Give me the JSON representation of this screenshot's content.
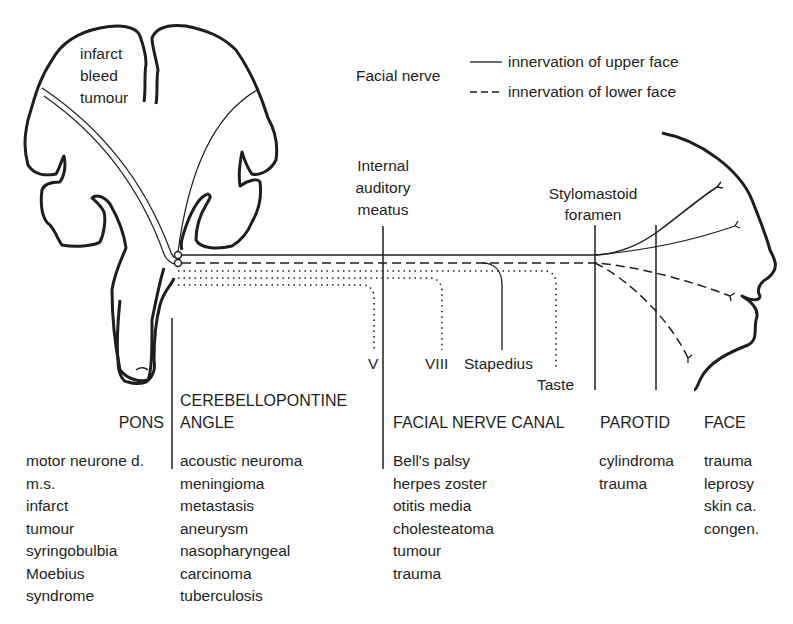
{
  "figure": {
    "brain_lesion_labels": [
      "infarct",
      "bleed",
      "tumour"
    ],
    "legend": {
      "title": "Facial nerve",
      "items": [
        {
          "style": "solid",
          "label": "innervation of upper face"
        },
        {
          "style": "dashed",
          "label": "innervation of lower face"
        }
      ]
    },
    "landmarks": {
      "internal_auditory_meatus": [
        "Internal",
        "auditory",
        "meatus"
      ],
      "stylomastoid_foramen": [
        "Stylomastoid",
        "foramen"
      ]
    },
    "branches": {
      "v": "V",
      "viii": "VIII",
      "stapedius": "Stapedius",
      "taste": "Taste"
    },
    "colors": {
      "line": "#1e1e1e",
      "background": "#ffffff"
    }
  },
  "regions": [
    {
      "name": "PONS",
      "causes": [
        "motor neurone d.",
        "m.s.",
        "infarct",
        "tumour",
        "syringobulbia",
        "Moebius",
        "syndrome"
      ]
    },
    {
      "name": "CEREBELLOPONTINE ANGLE",
      "name_lines": [
        "CEREBELLOPONTINE",
        "ANGLE"
      ],
      "causes": [
        "acoustic neuroma",
        "meningioma",
        "metastasis",
        "aneurysm",
        "nasopharyngeal",
        "carcinoma",
        "tuberculosis"
      ]
    },
    {
      "name": "FACIAL NERVE CANAL",
      "causes": [
        "Bell's palsy",
        "herpes zoster",
        "otitis media",
        "cholesteatoma",
        "tumour",
        "trauma"
      ]
    },
    {
      "name": "PAROTID",
      "causes": [
        "cylindroma",
        "trauma"
      ]
    },
    {
      "name": "FACE",
      "causes": [
        "trauma",
        "leprosy",
        "skin ca.",
        "congen."
      ]
    }
  ]
}
